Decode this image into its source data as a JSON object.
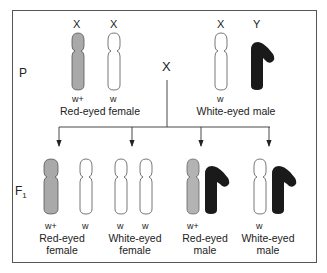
{
  "generations": {
    "parental": "P",
    "f1": "F",
    "f1_sub": "1"
  },
  "cross_symbol": "X",
  "parents": {
    "female": {
      "chrom_labels": [
        "X",
        "X"
      ],
      "alleles": [
        "w+",
        "w"
      ],
      "name": "Red-eyed female"
    },
    "male": {
      "chrom_labels": [
        "X",
        "Y"
      ],
      "alleles": [
        "w"
      ],
      "name": "White-eyed male"
    }
  },
  "offspring": [
    {
      "alleles": [
        "w+",
        "w"
      ],
      "name_line1": "Red-eyed",
      "name_line2": "female"
    },
    {
      "alleles": [
        "w",
        "w"
      ],
      "name_line1": "White-eyed",
      "name_line2": "female"
    },
    {
      "alleles": [
        "w+"
      ],
      "name_line1": "Red-eyed",
      "name_line2": "male"
    },
    {
      "alleles": [
        "w"
      ],
      "name_line1": "White-eyed",
      "name_line2": "male"
    }
  ],
  "colors": {
    "red_allele_chrom": "#a9a9a9",
    "white_allele_chrom": "#ffffff",
    "y_chrom": "#1a1a1a",
    "outline": "#444444"
  }
}
